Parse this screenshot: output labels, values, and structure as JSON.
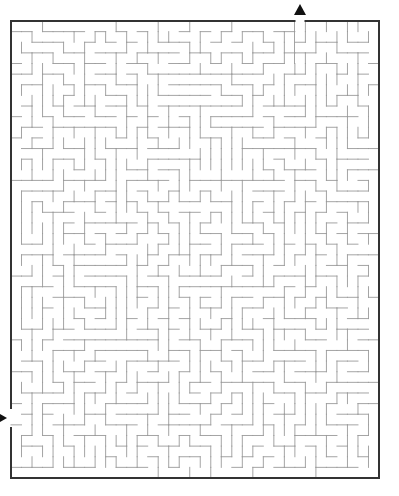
{
  "maze": {
    "canvas": {
      "width": 399,
      "height": 496
    },
    "border": {
      "left": 11,
      "top": 21,
      "right": 379,
      "bottom": 478,
      "color": "#333333",
      "stroke": 2
    },
    "grid": {
      "cols": 35,
      "rows": 43,
      "origin_x": 11,
      "origin_y": 21
    },
    "wall_color": "#9a9a9a",
    "wall_stroke": 0.9,
    "seed": 7319,
    "entrance": {
      "side": "left",
      "y": 418,
      "gap": 20,
      "arrow_color": "#111111",
      "arrow_direction": "right"
    },
    "exit": {
      "side": "top",
      "x": 300,
      "gap": 11,
      "arrow_color": "#111111",
      "arrow_direction": "up"
    }
  }
}
